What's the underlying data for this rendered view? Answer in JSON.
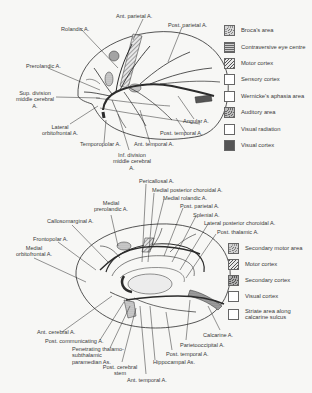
{
  "lateral_view": {
    "labels": {
      "ant_parietal": "Ant. parietal A.",
      "rolandic": "Rolandic A.",
      "post_parietal": "Post. parietal A.",
      "prerolandic": "Prerolandic A.",
      "sup_division_1": "Sup. division",
      "sup_division_2": "middle cerebral",
      "sup_division_3": "A.",
      "lateral_orbitofrontal_1": "Lateral",
      "lateral_orbitofrontal_2": "orbitofrontal A.",
      "temporopolar": "Temporopolar A.",
      "inf_division_1": "Inf. division",
      "inf_division_2": "middle cerebral",
      "inf_division_3": "A.",
      "ant_temporal": "Ant. temporal A.",
      "post_temporal": "Post. temporal A.",
      "angular": "Angular A."
    },
    "legend": [
      {
        "label": "Broca's area",
        "pattern": "stipple"
      },
      {
        "label": "Contraversive eye centre",
        "pattern": "horizontal"
      },
      {
        "label": "Motor cortex",
        "pattern": "diagonal"
      },
      {
        "label": "Sensory cortex",
        "pattern": "blank"
      },
      {
        "label": "Wernicke's aphasia area",
        "pattern": "blank"
      },
      {
        "label": "Auditory area",
        "pattern": "stipple"
      },
      {
        "label": "Visual radiation",
        "pattern": "blank"
      },
      {
        "label": "Visual cortex",
        "pattern": "dark"
      }
    ]
  },
  "medial_view": {
    "labels": {
      "pericallosal": "Pericallosal A.",
      "medial_post_choroidal": "Medial posterior choroidal A.",
      "medial_rolandic": "Medial rolandic A.",
      "post_parietal": "Post. parietal A.",
      "splenial": "Splenial A.",
      "lateral_post_choroidal": "Lateral posterior choroidal A.",
      "post_thalamic": "Post. thalamic A.",
      "medial_prerolandic_1": "Medial",
      "medial_prerolandic_2": "prerolandic A.",
      "callosomarginal": "Callosomarginal A.",
      "frontopolar": "Frontopolar A.",
      "medial_orbitofrontal_1": "Medial",
      "medial_orbitofrontal_2": "orbitofrontal A.",
      "ant_cerebral": "Ant. cerebral A.",
      "post_communicating": "Post. communicating A.",
      "penetrating_1": "Penetrating thalamo-",
      "penetrating_2": "subthalamic",
      "penetrating_3": "paramedian As.",
      "post_cerebral_1": "Post. cerebral",
      "post_cerebral_2": "stem",
      "ant_temporal": "Ant. temporal A.",
      "hippocampal": "Hippocampal As.",
      "post_temporal": "Post. temporal A.",
      "parietooccipital": "Parietooccipital A.",
      "calcarine": "Calcarine A."
    },
    "legend": [
      {
        "label": "Secondary motor area",
        "pattern": "stipple"
      },
      {
        "label": "Motor cortex",
        "pattern": "diagonal"
      },
      {
        "label": "Secondary cortex",
        "pattern": "stipple-dark"
      },
      {
        "label": "Visual cortex",
        "pattern": "blank"
      },
      {
        "label": "Striate area along",
        "label2": "calcarine sulcus",
        "pattern": "blank"
      }
    ]
  },
  "colors": {
    "line": "#2b2b2b",
    "background": "#f7f7f5",
    "dark_fill": "#555555",
    "stipple_fill": "#bdbdbd"
  }
}
